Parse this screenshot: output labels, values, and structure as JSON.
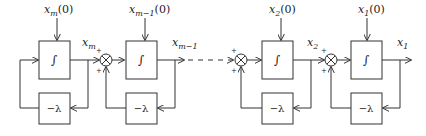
{
  "diagram": {
    "type": "cascaded integrator chain with feedback",
    "stages": [
      {
        "id": "m",
        "initial_label": "x",
        "initial_sub": "m",
        "initial_suffix": "(0)",
        "output_label": "x",
        "output_sub": "m",
        "integrator": "∫",
        "feedback": "−λ"
      },
      {
        "id": "m-1",
        "initial_label": "x",
        "initial_sub": "m−1",
        "initial_suffix": "(0)",
        "output_label": "x",
        "output_sub": "m−1",
        "integrator": "∫",
        "feedback": "−λ"
      },
      {
        "id": "2",
        "initial_label": "x",
        "initial_sub": "2",
        "initial_suffix": "(0)",
        "output_label": "x",
        "output_sub": "2",
        "integrator": "∫",
        "feedback": "−λ"
      },
      {
        "id": "1",
        "initial_label": "x",
        "initial_sub": "1",
        "initial_suffix": "(0)",
        "output_label": "x",
        "output_sub": "1",
        "integrator": "∫",
        "feedback": "−λ"
      }
    ],
    "summing_junctions": [
      {
        "symbol": "⊗",
        "signs": [
          "+",
          "+"
        ]
      },
      {
        "symbol": "⊗",
        "signs": [
          "+",
          "+"
        ]
      },
      {
        "symbol": "⊗",
        "signs": [
          "+",
          "+"
        ]
      }
    ],
    "plus": "+"
  }
}
